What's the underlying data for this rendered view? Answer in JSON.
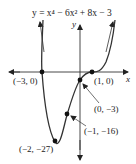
{
  "figure": {
    "equation": "y = x⁴ − 6x² + 8x − 3",
    "x_axis_label": "x",
    "y_axis_label": "y",
    "points": [
      {
        "label": "(−3, 0)",
        "x": -3,
        "y": 0
      },
      {
        "label": "(1, 0)",
        "x": 1,
        "y": 0
      },
      {
        "label": "(0, −3)",
        "x": 0,
        "y": -3
      },
      {
        "label": "(−1, −16)",
        "x": -1,
        "y": -16
      },
      {
        "label": "(−2, −27)",
        "x": -2,
        "y": -27
      }
    ],
    "colors": {
      "curve": "#333333",
      "axes": "#333333",
      "points": "#111111"
    }
  }
}
